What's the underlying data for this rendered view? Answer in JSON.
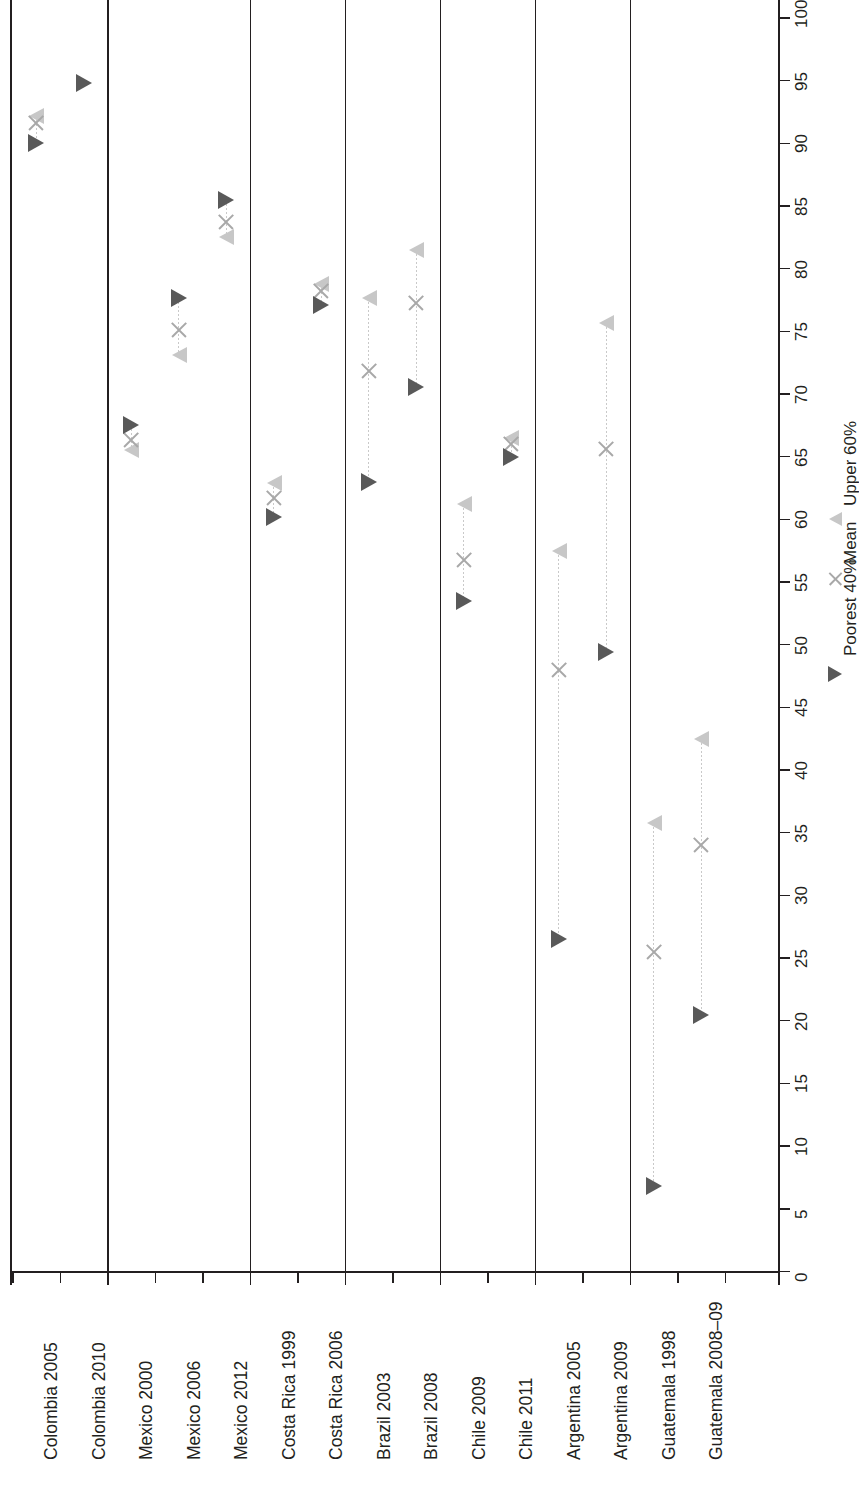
{
  "chart_data": {
    "type": "scatter",
    "orientation": "horizontal-bars-rotated",
    "title": "",
    "subtitle": "",
    "xlabel": "",
    "ylabel": "",
    "value_axis": {
      "min": 0,
      "max": 100,
      "tick_step": 5,
      "ticks": [
        0,
        5,
        10,
        15,
        20,
        25,
        30,
        35,
        40,
        45,
        50,
        55,
        60,
        65,
        70,
        75,
        80,
        85,
        90,
        95,
        100
      ],
      "tick_labels": [
        "0",
        "5",
        "10",
        "15",
        "20",
        "25",
        "30",
        "35",
        "40",
        "45",
        "50",
        "55",
        "60",
        "65",
        "70",
        "75",
        "80",
        "85",
        "90",
        "95",
        "100"
      ],
      "grid": false
    },
    "categories": [
      "Colombia 2005",
      "Colombia 2010",
      "Mexico 2000",
      "Mexico 2006",
      "Mexico 2012",
      "Costa Rica 1999",
      "Costa Rica 2006",
      "Brazil 2003",
      "Brazil 2008",
      "Chile 2009",
      "Chile 2011",
      "Argentina 2005",
      "Argentina 2009",
      "Guatemala 1998",
      "Guatemala 2008–09"
    ],
    "group_breaks_after": [
      "Colombia 2010",
      "Mexico 2012",
      "Costa Rica 2006",
      "Brazil 2008",
      "Chile 2011",
      "Argentina 2009"
    ],
    "series": [
      {
        "name": "Poorest 40%",
        "marker": "triangle-right",
        "color": "#595959",
        "values": [
          90.0,
          94.8,
          67.5,
          77.7,
          85.5,
          60.2,
          77.1,
          63.0,
          70.6,
          53.5,
          65.0,
          26.5,
          49.4,
          6.8,
          20.5
        ]
      },
      {
        "name": "Mean",
        "marker": "x",
        "color": "#a8a8a8",
        "values": [
          91.6,
          null,
          66.3,
          75.1,
          83.7,
          61.7,
          78.2,
          71.8,
          77.3,
          56.8,
          66.0,
          48.0,
          65.6,
          25.5,
          34.0
        ]
      },
      {
        "name": "Upper 60%",
        "marker": "triangle-left",
        "color": "#c7c7c7",
        "values": [
          92.2,
          null,
          65.5,
          73.1,
          82.5,
          62.9,
          78.8,
          77.7,
          81.5,
          61.2,
          66.5,
          57.5,
          75.7,
          35.8,
          42.5
        ]
      }
    ],
    "legend": {
      "position": "bottom-right",
      "entries": [
        {
          "label": "Poorest 40%",
          "marker": "triangle-right",
          "color": "#595959"
        },
        {
          "label": "Mean",
          "marker": "x",
          "color": "#a8a8a8"
        },
        {
          "label": "Upper 60%",
          "marker": "triangle-left",
          "color": "#c7c7c7"
        }
      ]
    },
    "colors": {
      "axis": "#231f20",
      "poorest": "#595959",
      "mean": "#a8a8a8",
      "upper": "#c7c7c7",
      "background": "#ffffff"
    }
  }
}
